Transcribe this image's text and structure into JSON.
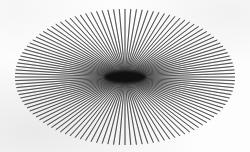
{
  "figure": {
    "caption": "",
    "background_color": "#fdfdfd",
    "line_color": "#2b2b2b",
    "core_color": "#12100f"
  },
  "chart_data": {
    "type": "scatter",
    "subtitle": "",
    "xlabel": "",
    "ylabel": "",
    "grid": false,
    "legend": null,
    "axes_visible": false,
    "tick_labels": [],
    "annotations": [],
    "geometry": {
      "canvas_width": 250,
      "canvas_height": 152,
      "center_x": 125,
      "center_y": 77,
      "ellipse_semi_axis_x": 110,
      "ellipse_semi_axis_y": 68,
      "ray_count": 120,
      "angle_step_degrees": 3,
      "angle_start_degrees": 0,
      "line_width_px": 0.72,
      "inner_radius_px": 0,
      "core_blob_width_px": 42,
      "core_blob_height_px": 12
    },
    "extents": {
      "left_px": 15,
      "right_px": 235,
      "top_px": 9,
      "bottom_px": 145
    },
    "colors": {
      "line": "#2b2b2b",
      "background": "#fdfdfd",
      "core": "#12100f"
    }
  }
}
